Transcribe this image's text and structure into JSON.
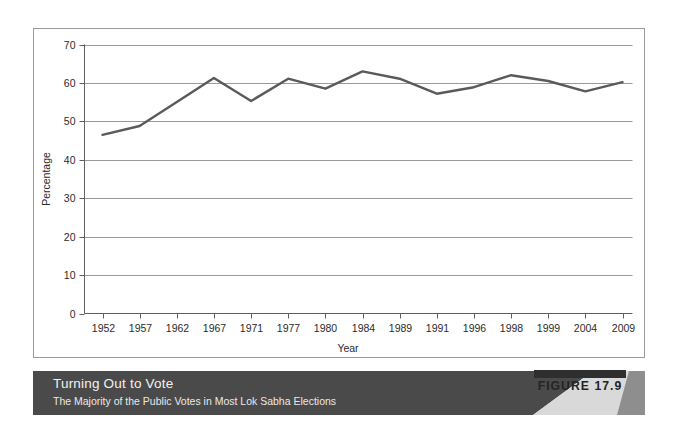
{
  "figure": {
    "badge_label": "FIGURE 17.9",
    "banner_title": "Turning Out to Vote",
    "banner_subtitle": "The Majority of the Public Votes in Most Lok Sabha Elections"
  },
  "colors": {
    "line": "#5a5a5a",
    "grid": "#8f8f8f",
    "axis": "#5f5f5f",
    "frame": "#9a9a9a",
    "banner_dark": "#4a4a4a",
    "banner_mid": "#6e6e6e",
    "banner_light": "#d9d9d9",
    "badge_bar": "#2e2e2e",
    "text_light": "#f2f2f2",
    "text_dark": "#2b2b2b"
  },
  "chart_data": {
    "type": "line",
    "title": "Turning Out to Vote",
    "subtitle": "The Majority of the Public Votes in Most Lok Sabha Elections",
    "xlabel": "Year",
    "ylabel": "Percentage",
    "categories": [
      "1952",
      "1957",
      "1962",
      "1967",
      "1971",
      "1977",
      "1980",
      "1984",
      "1989",
      "1991",
      "1996",
      "1998",
      "1999",
      "2004",
      "2009"
    ],
    "values": [
      46.5,
      48.8,
      55.0,
      61.3,
      55.3,
      61.1,
      58.5,
      63.0,
      61.1,
      57.2,
      58.9,
      62.0,
      60.5,
      57.8,
      60.2
    ],
    "series": [
      {
        "name": "Voter turnout",
        "values": [
          46.5,
          48.8,
          55.0,
          61.3,
          55.3,
          61.1,
          58.5,
          63.0,
          61.1,
          57.2,
          58.9,
          62.0,
          60.5,
          57.8,
          60.2
        ]
      }
    ],
    "yticks": [
      0,
      10,
      20,
      30,
      40,
      50,
      60,
      70
    ],
    "ytick_labels": [
      "0",
      "10",
      "20",
      "30",
      "40",
      "50",
      "60",
      "70"
    ],
    "ylim": [
      0,
      70
    ],
    "grid": "horizontal",
    "legend": "none",
    "markers": "none"
  }
}
